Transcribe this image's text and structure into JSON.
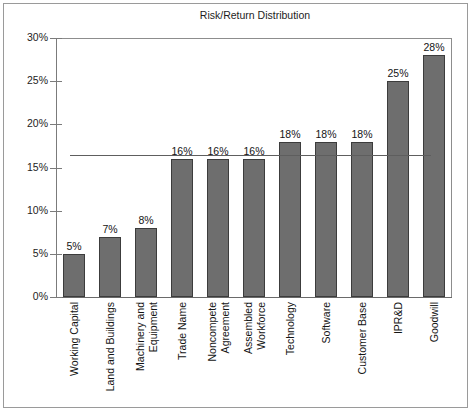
{
  "chart_data": {
    "type": "bar",
    "title": "Risk/Return Distribution",
    "xlabel": "",
    "ylabel": "",
    "ylim": [
      0,
      30
    ],
    "ytick_values": [
      30,
      25,
      20,
      15,
      10,
      5,
      0
    ],
    "ytick_labels": [
      "30%",
      "25%",
      "20%",
      "15%",
      "10%",
      "5%",
      "0%"
    ],
    "grid": false,
    "legend": "none",
    "value_suffix": "%",
    "categories": [
      "Working Capital",
      "Land and Buildings",
      "Machinery and Equipment",
      "Trade Name",
      "Noncompete Agreement",
      "Assembled Workforce",
      "Technology",
      "Software",
      "Customer Base",
      "IPR&D",
      "Goodwill"
    ],
    "category_lines": [
      [
        "Working Capital"
      ],
      [
        "Land and Buildings"
      ],
      [
        "Machinery and",
        "Equipment"
      ],
      [
        "Trade Name"
      ],
      [
        "Noncompete",
        "Agreement"
      ],
      [
        "Assembled",
        "Workforce"
      ],
      [
        "Technology"
      ],
      [
        "Software"
      ],
      [
        "Customer Base"
      ],
      [
        "IPR&D"
      ],
      [
        "Goodwill"
      ]
    ],
    "values": [
      5,
      7,
      8,
      16,
      16,
      16,
      18,
      18,
      18,
      25,
      28
    ],
    "data_labels": [
      "5%",
      "7%",
      "8%",
      "16%",
      "16%",
      "16%",
      "18%",
      "18%",
      "18%",
      "25%",
      "28%"
    ],
    "reference_line": {
      "name": "weighted average rate of return",
      "value": 16.5,
      "label": ""
    },
    "colors": {
      "bar_fill": "#6e6e6e",
      "bar_edge": "#3c3c3c",
      "reference_line": "#5e5e5e",
      "axis": "#7b7b7b",
      "frame": "#8d8d8d",
      "outer_frame": "#9a9a9a",
      "text": "#141414",
      "background": "#ffffff"
    }
  }
}
